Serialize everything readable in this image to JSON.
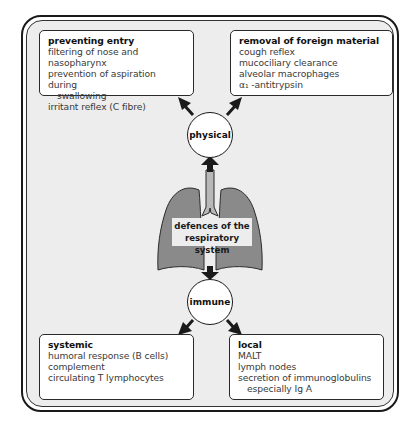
{
  "diagram": {
    "center_label": [
      "defences of the",
      "respiratory system"
    ],
    "nodes": {
      "physical": "physical",
      "immune": "immune"
    },
    "boxes": {
      "preventing_entry": {
        "title": "preventing entry",
        "lines": [
          "filtering of nose and nasopharynx",
          "prevention of aspiration during",
          "swallowing",
          "irritant reflex (C fibre)"
        ]
      },
      "removal": {
        "title": "removal of foreign material",
        "lines": [
          "cough reflex",
          "mucociliary clearance",
          "alveolar macrophages",
          "α₁ -antitrypsin"
        ]
      },
      "systemic": {
        "title": "systemic",
        "lines": [
          "humoral response (B cells)",
          "complement",
          "circulating T lymphocytes"
        ]
      },
      "local": {
        "title": "local",
        "lines": [
          "MALT",
          "lymph nodes",
          "secretion of immunoglobulins",
          "especially Ig A"
        ]
      }
    },
    "colors": {
      "lung_fill": "#8a8a8a",
      "trachea_fill": "#b8b8b8",
      "frame_fill": "#ededed",
      "outline": "#1a1a1a"
    }
  }
}
